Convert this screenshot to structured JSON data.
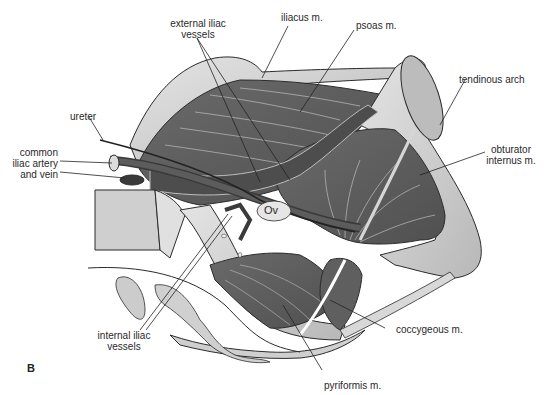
{
  "figure": {
    "panel_letter": "B",
    "structure_label": "Ov",
    "labels": {
      "external_iliac": [
        "external iliac",
        "vessels"
      ],
      "iliacus": "iliacus m.",
      "psoas": "psoas m.",
      "tendinous_arch": "tendinous arch",
      "ureter": "ureter",
      "common_iliac": [
        "common",
        "iliac artery",
        "and vein"
      ],
      "obturator": [
        "obturator",
        "internus m."
      ],
      "internal_iliac": [
        "internal iliac",
        "vessels"
      ],
      "coccygeous": "coccygeous m.",
      "pyriformis": "pyriformis m."
    },
    "colors": {
      "muscle_dark": "#5a5a5a",
      "muscle_mid": "#6e6e6e",
      "bone_light": "#c8c8c8",
      "bone_lighter": "#dcdcdc",
      "outline": "#2b2b2b",
      "fiber": "#bdbdbd",
      "background": "#ffffff"
    }
  }
}
